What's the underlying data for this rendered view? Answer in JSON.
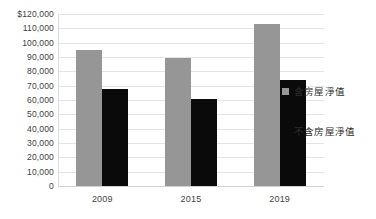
{
  "chart_data": {
    "type": "bar",
    "title": "",
    "subtitle": "",
    "xlabel": "",
    "ylabel": "",
    "categories": [
      "2009",
      "2015",
      "2019"
    ],
    "series": [
      {
        "name": "含房屋淨值",
        "color": "#969696",
        "values": [
          95000,
          89000,
          113000
        ]
      },
      {
        "name": "不含房屋淨值",
        "color": "#0a0a0a",
        "values": [
          68000,
          61000,
          74000
        ]
      }
    ],
    "ylim": [
      0,
      120000
    ],
    "ytick_step": 10000,
    "ytick_labels": [
      "$120,000",
      "110,000",
      "100,000",
      "90,000",
      "80,000",
      "70,000",
      "60,000",
      "50,000",
      "40,000",
      "30,000",
      "20,000",
      "10,000",
      "0"
    ],
    "ytick_values": [
      120000,
      110000,
      100000,
      90000,
      80000,
      70000,
      60000,
      50000,
      40000,
      30000,
      20000,
      10000,
      0
    ],
    "grid": true,
    "grid_color": "#e4e4e4",
    "legend_position": "right",
    "background": "#ffffff"
  }
}
